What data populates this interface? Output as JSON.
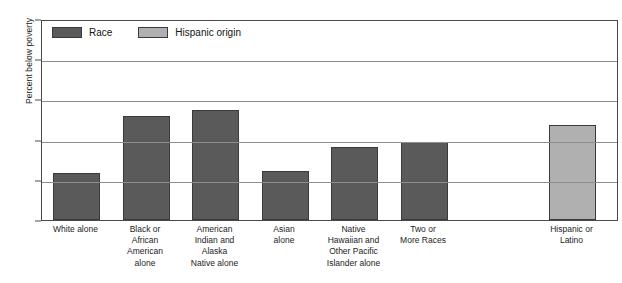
{
  "chart_data": {
    "type": "bar",
    "title": "",
    "xlabel": "",
    "ylabel": "Percent below poverty",
    "ylim": [
      0,
      50
    ],
    "yticks": [
      0,
      10,
      20,
      30,
      40,
      50
    ],
    "grid": true,
    "legend_position": "top-left inside plot",
    "legend": [
      {
        "name": "Race",
        "color": "#5a5a5a"
      },
      {
        "name": "Hispanic origin",
        "color": "#b0b0b0"
      }
    ],
    "categories": [
      "White alone",
      "Black or African American alone",
      "American Indian and Alaska Native alone",
      "Asian alone",
      "Native Hawaiian and Other Pacific Islander alone",
      "Two or More Races",
      "Hispanic or Latino"
    ],
    "category_label_lines": [
      [
        "White alone"
      ],
      [
        "Black or",
        "African",
        "American",
        "alone"
      ],
      [
        "American",
        "Indian and",
        "Alaska",
        "Native alone"
      ],
      [
        "Asian",
        "alone"
      ],
      [
        "Native",
        "Hawaiian and",
        "Other Pacific",
        "Islander alone"
      ],
      [
        "Two or",
        "More Races"
      ],
      [
        "Hispanic or",
        "Latino"
      ]
    ],
    "values": [
      11.8,
      25.8,
      27.3,
      12.2,
      18.2,
      19.3,
      23.7
    ],
    "series_of_bar": [
      "Race",
      "Race",
      "Race",
      "Race",
      "Race",
      "Race",
      "Hispanic origin"
    ]
  },
  "axis": {
    "y_title": "Percent below poverty",
    "tick_labels": [
      "0",
      "10",
      "20",
      "30",
      "40",
      "50"
    ]
  },
  "legend": {
    "race_label": "Race",
    "hispanic_label": "Hispanic origin"
  }
}
